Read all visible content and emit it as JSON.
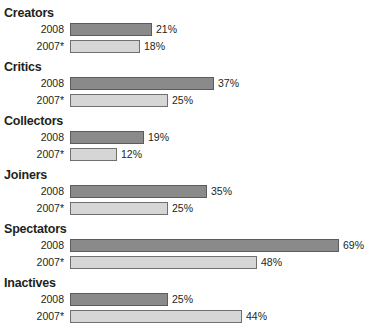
{
  "chart_data": {
    "type": "bar",
    "orientation": "horizontal",
    "title": "",
    "xlabel": "",
    "ylabel": "",
    "xlim": [
      0,
      69
    ],
    "grid": false,
    "legend": "none",
    "categories": [
      "Creators",
      "Critics",
      "Collectors",
      "Joiners",
      "Spectators",
      "Inactives"
    ],
    "series": [
      {
        "name": "2008",
        "style": "dark",
        "values": [
          21,
          37,
          19,
          35,
          69,
          25
        ],
        "labels": [
          "21%",
          "37%",
          "19%",
          "35%",
          "69%",
          "25%"
        ]
      },
      {
        "name": "2007*",
        "style": "light",
        "values": [
          18,
          25,
          12,
          25,
          48,
          44
        ],
        "labels": [
          "18%",
          "25%",
          "12%",
          "25%",
          "48%",
          "44%"
        ]
      }
    ],
    "groups": [
      {
        "label": "Creators",
        "rows": [
          {
            "label": "2008",
            "value": 21,
            "display": "21%",
            "style": "dark"
          },
          {
            "label": "2007*",
            "value": 18,
            "display": "18%",
            "style": "light"
          }
        ]
      },
      {
        "label": "Critics",
        "rows": [
          {
            "label": "2008",
            "value": 37,
            "display": "37%",
            "style": "dark"
          },
          {
            "label": "2007*",
            "value": 25,
            "display": "25%",
            "style": "light"
          }
        ]
      },
      {
        "label": "Collectors",
        "rows": [
          {
            "label": "2008",
            "value": 19,
            "display": "19%",
            "style": "dark"
          },
          {
            "label": "2007*",
            "value": 12,
            "display": "12%",
            "style": "light"
          }
        ]
      },
      {
        "label": "Joiners",
        "rows": [
          {
            "label": "2008",
            "value": 35,
            "display": "35%",
            "style": "dark"
          },
          {
            "label": "2007*",
            "value": 25,
            "display": "25%",
            "style": "light"
          }
        ]
      },
      {
        "label": "Spectators",
        "rows": [
          {
            "label": "2008",
            "value": 69,
            "display": "69%",
            "style": "dark"
          },
          {
            "label": "2007*",
            "value": 48,
            "display": "48%",
            "style": "light"
          }
        ]
      },
      {
        "label": "Inactives",
        "rows": [
          {
            "label": "2008",
            "value": 25,
            "display": "25%",
            "style": "dark"
          },
          {
            "label": "2007*",
            "value": 44,
            "display": "44%",
            "style": "light"
          }
        ]
      }
    ],
    "colors": {
      "dark_bar": "#8a8a8a",
      "dark_bar_border": "#5c5c5c",
      "light_bar": "#d6d6d6",
      "light_bar_border": "#6f6f6f",
      "text": "#231f20",
      "background": "#ffffff"
    },
    "scale": {
      "pixels_per_percent": 3.9,
      "bar_origin_x": 70
    }
  }
}
